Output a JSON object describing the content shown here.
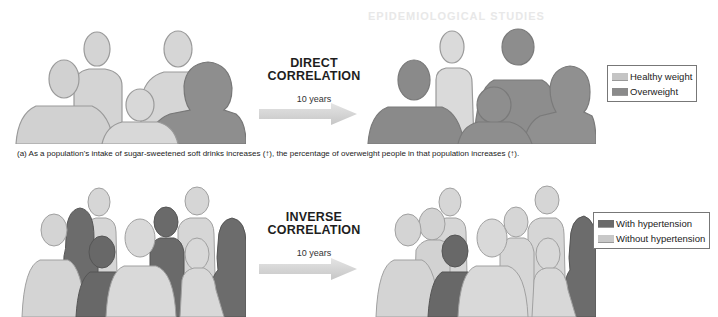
{
  "background_bleed": {
    "heading": "EPIDEMIOLOGICAL STUDIES"
  },
  "panel_a": {
    "correlation_label_line1": "DIRECT",
    "correlation_label_line2": "CORRELATION",
    "time_label": "10 years",
    "legend": [
      {
        "label": "Healthy weight",
        "color": "#c4c4c4"
      },
      {
        "label": "Overweight",
        "color": "#8a8a8a"
      }
    ],
    "before": {
      "people": [
        {
          "status": "healthy",
          "color": "#d2d2d2"
        },
        {
          "status": "healthy",
          "color": "#d2d2d2"
        },
        {
          "status": "healthy",
          "color": "#cfcfcf"
        },
        {
          "status": "healthy",
          "color": "#d6d6d6"
        },
        {
          "status": "overweight",
          "color": "#8e8e8e"
        }
      ]
    },
    "after": {
      "people": [
        {
          "status": "healthy",
          "color": "#d6d6d6"
        },
        {
          "status": "overweight",
          "color": "#8c8c8c"
        },
        {
          "status": "overweight",
          "color": "#8c8c8c"
        },
        {
          "status": "overweight",
          "color": "#8a8a8a"
        },
        {
          "status": "overweight",
          "color": "#909090"
        }
      ]
    },
    "caption": "(a) As a population's intake of sugar-sweetened soft drinks increases (↑), the percentage of overweight people in that population increases (↑)."
  },
  "panel_b": {
    "correlation_label_line1": "INVERSE",
    "correlation_label_line2": "CORRELATION",
    "time_label": "10 years",
    "legend": [
      {
        "label": "With hypertension",
        "color": "#6a6a6a"
      },
      {
        "label": "Without hypertension",
        "color": "#c8c8c8"
      }
    ],
    "before": {
      "with_hypertension": 4,
      "without_hypertension": 5
    },
    "after": {
      "with_hypertension": 2,
      "without_hypertension": 7
    }
  },
  "colors": {
    "light_figure": "#d3d3d3",
    "light_figure_edge": "#a8a8a8",
    "dark_figure": "#8c8c8c",
    "hyper_figure": "#6b6b6b",
    "arrow": "#cfcfcf"
  }
}
